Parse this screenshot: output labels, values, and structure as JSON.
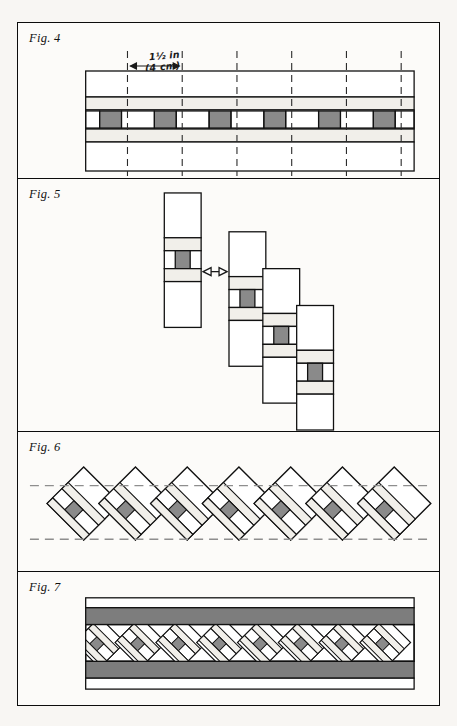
{
  "page": {
    "background_color": "#f8f6f3",
    "frame_color": "#0c0c0c",
    "paper_color": "#fcfbf9"
  },
  "palette": {
    "ink": "#111111",
    "light_fabric": "#f1efea",
    "dark_fabric": "#8a8a8a",
    "band_fabric": "#7d7d7d",
    "white_fabric": "#ffffff",
    "dashed_guide": "#8e8e8e"
  },
  "figures": [
    {
      "id": "fig4",
      "label": "Fig. 4",
      "caption_measure_line1": "1½ in",
      "caption_measure_line2": "(4 cm)",
      "description": "Pieced strip set shown flat with dashed vertical cutting lines spaced 1½ in apart.",
      "cut_lines_count": 6,
      "cut_spacing_label": "1½ in (4 cm)",
      "strip_rows": [
        {
          "name": "outer-white-top",
          "fill": "#ffffff",
          "height_pct": 26
        },
        {
          "name": "light-band-top",
          "fill": "#f1efea",
          "height_pct": 13
        },
        {
          "name": "checker-center",
          "fill": "#ffffff",
          "height_pct": 19
        },
        {
          "name": "light-band-bottom",
          "fill": "#f1efea",
          "height_pct": 13
        },
        {
          "name": "outer-white-bottom",
          "fill": "#ffffff",
          "height_pct": 29
        }
      ],
      "checker_squares": 12,
      "checker_dark_fill": "#8a8a8a"
    },
    {
      "id": "fig5",
      "label": "Fig. 5",
      "description": "Four cut segments offset in a descending staircase; arrow shows the offset between the first and second segment.",
      "segments": 4,
      "arrow": {
        "name": "offset-arrow",
        "type": "double-headed-horizontal"
      },
      "segment_rows": [
        {
          "name": "white-top",
          "fill": "#ffffff"
        },
        {
          "name": "light-band-top",
          "fill": "#f1efea"
        },
        {
          "name": "center-row",
          "fill": "#ffffff"
        },
        {
          "name": "light-band-bottom",
          "fill": "#f1efea"
        },
        {
          "name": "white-bottom",
          "fill": "#ffffff"
        }
      ]
    },
    {
      "id": "fig6",
      "label": "Fig. 6",
      "description": "Joined segments rotated on point forming a row of overlapping diamonds; two horizontal dashed lines mark the trim lines.",
      "diamonds": 7,
      "guide_lines": 2,
      "guide_style": "dashed"
    },
    {
      "id": "fig7",
      "label": "Fig. 7",
      "description": "Finished border: trimmed diamond band with a dark border strip sewn to top and bottom edges.",
      "diamonds": 8,
      "bands": [
        {
          "name": "outer-white-top",
          "fill": "#ffffff"
        },
        {
          "name": "dark-border-top",
          "fill": "#7d7d7d"
        },
        {
          "name": "diamond-band",
          "fill": "#ffffff"
        },
        {
          "name": "dark-border-bottom",
          "fill": "#7d7d7d"
        },
        {
          "name": "outer-white-bottom",
          "fill": "#ffffff"
        }
      ]
    }
  ]
}
